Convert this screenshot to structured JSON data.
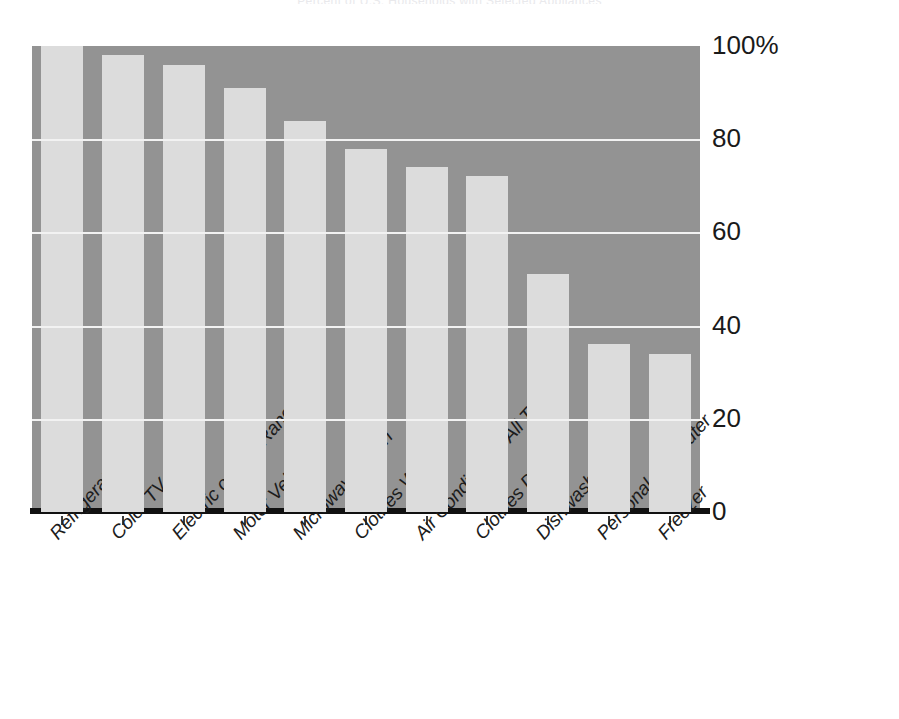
{
  "chart_data": {
    "type": "bar",
    "title": "Percent of U.S. Households with Selected Appliances",
    "xlabel": "",
    "ylabel": "",
    "ylim": [
      0,
      100
    ],
    "grid": true,
    "legend": false,
    "categories": [
      "Refrigerator",
      "Color TV",
      "Electric or Gas Range",
      "Motor Vehicle",
      "Microwave Oven",
      "Clothes Washer",
      "Air Conditioner, All Types",
      "Clothes Dryer",
      "Dishwasher",
      "Personal Computer",
      "Freezer"
    ],
    "values": [
      100,
      98,
      96,
      91,
      84,
      78,
      74,
      72,
      51,
      36,
      34
    ],
    "y_ticks": [
      "0",
      "20",
      "40",
      "60",
      "80",
      "100%"
    ],
    "y_tick_values": [
      0,
      20,
      40,
      60,
      80,
      100
    ],
    "units": "percent"
  },
  "colors": {
    "plot_background": "#939393",
    "bar_fill": "#dcdcdc",
    "gridline": "#f2f2f2",
    "baseline": "#111111",
    "text": "#1a1a1a",
    "page_background": "#ffffff"
  }
}
